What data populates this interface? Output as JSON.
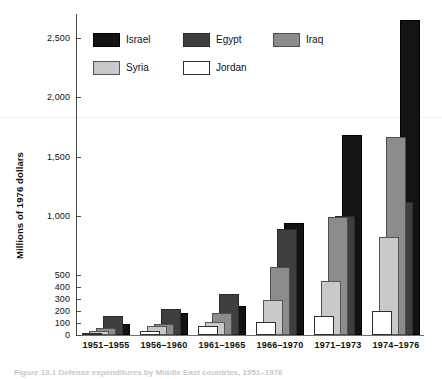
{
  "chart_data": {
    "type": "bar",
    "title": "",
    "xlabel": "",
    "ylabel": "Millions of 1976 dollars",
    "categories": [
      "1951–1955",
      "1956–1960",
      "1961–1965",
      "1966–1970",
      "1971–1973",
      "1974–1976"
    ],
    "series": [
      {
        "name": "Israel",
        "color": "#131313",
        "values": [
          95,
          185,
          240,
          940,
          1680,
          2650
        ]
      },
      {
        "name": "Egypt",
        "color": "#3f3f3f",
        "values": [
          155,
          215,
          340,
          890,
          1000,
          1120
        ]
      },
      {
        "name": "Iraq",
        "color": "#8c8c8c",
        "values": [
          55,
          95,
          185,
          565,
          990,
          1665
        ]
      },
      {
        "name": "Syria",
        "color": "#c9c9c9",
        "values": [
          35,
          75,
          105,
          295,
          450,
          820
        ]
      },
      {
        "name": "Jordan",
        "color": "#ffffff",
        "values": [
          20,
          35,
          75,
          110,
          155,
          200
        ]
      }
    ],
    "ytick_labels": [
      "0",
      "100",
      "200",
      "300",
      "400",
      "500",
      "1,000",
      "1,500",
      "2,000",
      "2,500"
    ],
    "ytick_values": [
      0,
      100,
      200,
      300,
      400,
      500,
      1000,
      1500,
      2000,
      2500
    ],
    "ylim": [
      0,
      2750
    ],
    "axis_note": "compressed/expanded lower scale: 0-500 shown with 100-unit ticks",
    "grid": false,
    "legend_position": "top-left"
  },
  "legend": {
    "rows": [
      [
        {
          "label": "Israel",
          "key": "israel"
        },
        {
          "label": "Egypt",
          "key": "egypt"
        },
        {
          "label": "Iraq",
          "key": "iraq"
        }
      ],
      [
        {
          "label": "Syria",
          "key": "syria"
        },
        {
          "label": "Jordan",
          "key": "jordan"
        }
      ]
    ]
  },
  "axis": {
    "y_title": "Millions of 1976 dollars"
  },
  "caption": {
    "text": "Figure 13.1  Defense expenditures by Middle East countries, 1951–1976"
  }
}
